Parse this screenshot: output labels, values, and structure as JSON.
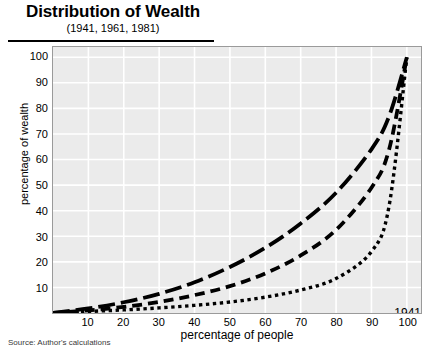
{
  "header": {
    "title": "Distribution of Wealth",
    "subtitle": "(1941, 1961, 1981)"
  },
  "source_note": "Source: Author's calculations",
  "legend": {
    "position": "inside-bottom-right",
    "entries": [
      {
        "label": "1941",
        "dash": "dotted",
        "sample_name": "legend-sample-1941"
      },
      {
        "label": "1961",
        "dash": "long-dash",
        "sample_name": "legend-sample-1961"
      },
      {
        "label": "1981",
        "dash": "medium-dash",
        "sample_name": "legend-sample-1981"
      }
    ]
  },
  "chart_data": {
    "type": "line",
    "title": "Distribution of Wealth",
    "subtitle": "(1941, 1961, 1981)",
    "xlabel": "percentage of people",
    "ylabel": "percentage of wealth",
    "xlim": [
      0,
      104
    ],
    "ylim": [
      0,
      104
    ],
    "xticks": [
      10,
      20,
      30,
      40,
      50,
      60,
      70,
      80,
      90,
      100
    ],
    "yticks": [
      10,
      20,
      30,
      40,
      50,
      60,
      70,
      80,
      90,
      100
    ],
    "grid": true,
    "grid_color": "#ffffff",
    "plot_background": "#ebebeb",
    "line_color": "#000000",
    "x": [
      0,
      10,
      20,
      30,
      40,
      50,
      60,
      70,
      80,
      90,
      95,
      100
    ],
    "series": [
      {
        "name": "1941",
        "dash": "dotted",
        "values": [
          0,
          0.6,
          1.2,
          2.0,
          3.0,
          4.3,
          6.2,
          9.0,
          13.5,
          24.0,
          42.0,
          100
        ]
      },
      {
        "name": "1961",
        "dash": "long-dash",
        "values": [
          0,
          1.8,
          4.2,
          7.5,
          12.0,
          18.0,
          25.5,
          35.0,
          47.0,
          64.0,
          77.0,
          100
        ]
      },
      {
        "name": "1981",
        "dash": "medium-dash",
        "values": [
          0,
          1.0,
          2.4,
          4.3,
          7.0,
          10.5,
          15.5,
          22.5,
          32.5,
          49.0,
          64.0,
          100
        ]
      }
    ]
  }
}
